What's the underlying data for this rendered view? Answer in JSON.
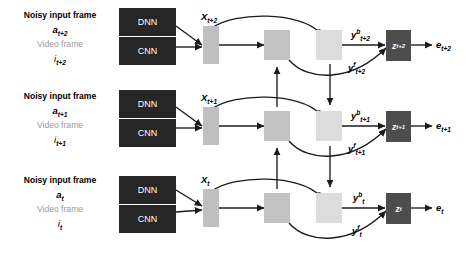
{
  "figure": {
    "type": "neural-network-architecture-diagram",
    "colors": {
      "dark_box": "#262626",
      "z_box": "#4d4d4d",
      "x_box": "#bfbfbf",
      "forward_box": "#c2c2c2",
      "backward_box": "#dcdcdc",
      "arrow": "#1a1a1a",
      "gray_text": "#9b9b9b",
      "background": "#ffffff"
    }
  },
  "rows": [
    {
      "id": "row-t-plus-2",
      "noisy_label": "Noisy input frame",
      "noisy_symbol_base": "a",
      "noisy_symbol_sub": "t+2",
      "video_label": "Video frame",
      "video_symbol_base": "i",
      "video_symbol_sub": "t+2",
      "dnn_label": "DNN",
      "cnn_label": "CNN",
      "x_base": "X",
      "x_sub": "t+2",
      "yb_base": "y",
      "yb_sup": "b",
      "yb_sub": "t+2",
      "yf_base": "y",
      "yf_sup": "f",
      "yf_sub": "t+2",
      "z_base": "z",
      "z_sub": "t+2",
      "e_base": "e",
      "e_sub": "t+2"
    },
    {
      "id": "row-t-plus-1",
      "noisy_label": "Noisy input frame",
      "noisy_symbol_base": "a",
      "noisy_symbol_sub": "t+1",
      "video_label": "Video frame",
      "video_symbol_base": "i",
      "video_symbol_sub": "t+1",
      "dnn_label": "DNN",
      "cnn_label": "CNN",
      "x_base": "X",
      "x_sub": "t+1",
      "yb_base": "y",
      "yb_sup": "b",
      "yb_sub": "t+1",
      "yf_base": "y",
      "yf_sup": "f",
      "yf_sub": "t+1",
      "z_base": "z",
      "z_sub": "t+1",
      "e_base": "e",
      "e_sub": "t+1"
    },
    {
      "id": "row-t",
      "noisy_label": "Noisy input frame",
      "noisy_symbol_base": "a",
      "noisy_symbol_sub": "t",
      "video_label": "Video frame",
      "video_symbol_base": "i",
      "video_symbol_sub": "t",
      "dnn_label": "DNN",
      "cnn_label": "CNN",
      "x_base": "X",
      "x_sub": "t",
      "yb_base": "y",
      "yb_sup": "b",
      "yb_sub": "t",
      "yf_base": "y",
      "yf_sup": "f",
      "yf_sub": "t",
      "z_base": "z",
      "z_sub": "t",
      "e_base": "e",
      "e_sub": "t"
    }
  ]
}
